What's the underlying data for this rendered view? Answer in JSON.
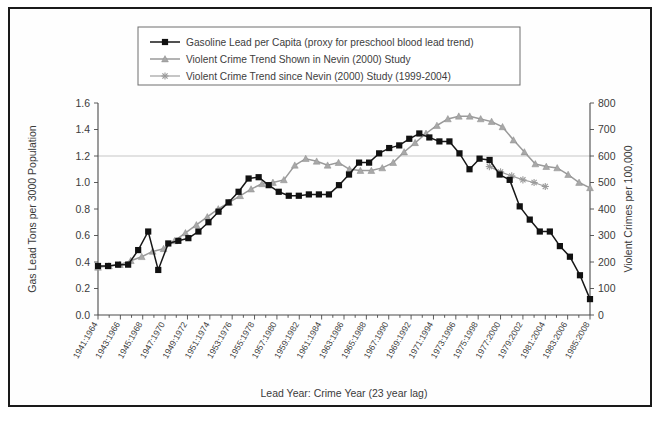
{
  "chart_data": {
    "type": "line",
    "title": "",
    "xlabel": "Lead Year: Crime Year (23 year lag)",
    "ylabel": "Gas Lead Tons per 3000 Population",
    "y2label": "Violent Crimes per 100,000",
    "ylim": [
      0.0,
      1.6
    ],
    "y2lim": [
      0,
      800
    ],
    "yticks": [
      "0.0",
      "0.2",
      "0.4",
      "0.6",
      "0.8",
      "1.0",
      "1.2",
      "1.4",
      "1.6"
    ],
    "y2ticks": [
      "0",
      "100",
      "200",
      "300",
      "400",
      "500",
      "600",
      "700",
      "800"
    ],
    "grid": "horizontal-light-at-1.2",
    "legend_position": "top-center",
    "x_tick_labels": [
      "1941:1964",
      "1943:1966",
      "1945:1968",
      "1947:1970",
      "1949:1972",
      "1951:1974",
      "1953:1976",
      "1955:1978",
      "1957:1980",
      "1959:1982",
      "1961:1984",
      "1963:1986",
      "1965:1988",
      "1967:1990",
      "1969:1992",
      "1971:1994",
      "1973:1996",
      "1975:1998",
      "1977:2000",
      "1979:2002",
      "1981:2004",
      "1983:2006",
      "1985:2008"
    ],
    "x_years": [
      1941,
      1942,
      1943,
      1944,
      1945,
      1946,
      1947,
      1948,
      1949,
      1950,
      1951,
      1952,
      1953,
      1954,
      1955,
      1956,
      1957,
      1958,
      1959,
      1960,
      1961,
      1962,
      1963,
      1964,
      1965,
      1966,
      1967,
      1968,
      1969,
      1970,
      1971,
      1972,
      1973,
      1974,
      1975,
      1976,
      1977,
      1978,
      1979,
      1980,
      1981,
      1982,
      1983,
      1984,
      1985
    ],
    "series": [
      {
        "name": "Gasoline Lead per Capita (proxy for preschool blood lead trend)",
        "marker": "filled-square",
        "color": "#111111",
        "axis": "left",
        "values": [
          0.37,
          0.37,
          0.38,
          0.38,
          0.49,
          0.63,
          0.34,
          0.54,
          0.56,
          0.58,
          0.63,
          0.7,
          0.78,
          0.85,
          0.93,
          1.03,
          1.04,
          0.98,
          0.93,
          0.9,
          0.9,
          0.91,
          0.91,
          0.91,
          0.98,
          1.06,
          1.15,
          1.15,
          1.22,
          1.26,
          1.28,
          1.33,
          1.37,
          1.34,
          1.31,
          1.31,
          1.22,
          1.1,
          1.18,
          1.17,
          1.06,
          1.02,
          0.82,
          0.72,
          0.63,
          0.63,
          0.52,
          0.44,
          0.3,
          0.12
        ]
      },
      {
        "name": "Violent Crime Trend Shown in Nevin (2000) Study",
        "marker": "triangle",
        "color": "#a8a8a8",
        "axis": "right",
        "values": [
          0.36,
          0.37,
          0.38,
          0.41,
          0.44,
          0.48,
          0.5,
          0.56,
          0.62,
          0.68,
          0.74,
          0.8,
          0.85,
          0.9,
          0.95,
          0.99,
          1.0,
          1.02,
          1.13,
          1.18,
          1.16,
          1.13,
          1.15,
          1.1,
          1.09,
          1.09,
          1.11,
          1.15,
          1.23,
          1.3,
          1.37,
          1.43,
          1.48,
          1.5,
          1.5,
          1.48,
          1.46,
          1.42,
          1.32,
          1.23,
          1.14,
          1.12,
          1.11,
          1.06,
          1.0,
          0.96
        ]
      },
      {
        "name": "Violent Crime Trend since Nevin (2000) Study (1999-2004)",
        "marker": "star",
        "color": "#9a9a9a",
        "axis": "right",
        "values": [
          1.12,
          1.08,
          1.05,
          1.02,
          1.0,
          0.97
        ],
        "x_start_year": 1976
      }
    ]
  },
  "legend": {
    "items": [
      {
        "label": "Gasoline Lead per Capita (proxy for preschool blood lead trend)",
        "marker": "filled-square"
      },
      {
        "label": "Violent Crime Trend Shown in Nevin (2000) Study",
        "marker": "triangle"
      },
      {
        "label": "Violent Crime Trend since Nevin (2000) Study (1999-2004)",
        "marker": "star"
      }
    ]
  }
}
